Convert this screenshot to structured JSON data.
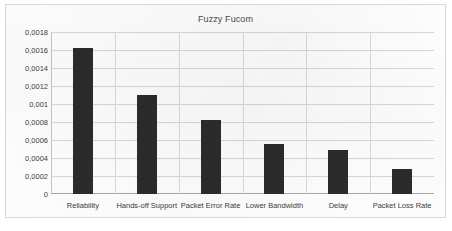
{
  "chart_data": {
    "type": "bar",
    "title": "Fuzzy Fucom",
    "xlabel": "",
    "ylabel": "",
    "categories": [
      "Reliability",
      "Hands-off Support",
      "Packet Error Rate",
      "Lower Bandwidth",
      "Delay",
      "Packet Loss Rate"
    ],
    "values": [
      0.00162,
      0.0011,
      0.00082,
      0.00056,
      0.00049,
      0.00028
    ],
    "ylim": [
      0,
      0.0018
    ],
    "ytick_labels": [
      "0,0018",
      "0,0016",
      "0,0014",
      "0,0012",
      "0,001",
      "0,0008",
      "0,0006",
      "0,0004",
      "0,0002",
      "0"
    ],
    "ytick_values": [
      0.0018,
      0.0016,
      0.0014,
      0.0012,
      0.001,
      0.0008,
      0.0006,
      0.0004,
      0.0002,
      0
    ],
    "grid": true,
    "legend": false,
    "bar_color": "#2b2b2b",
    "gridline_color": "#d6d6d6",
    "background_color": "#fdfdfd",
    "decimal_separator": ","
  }
}
